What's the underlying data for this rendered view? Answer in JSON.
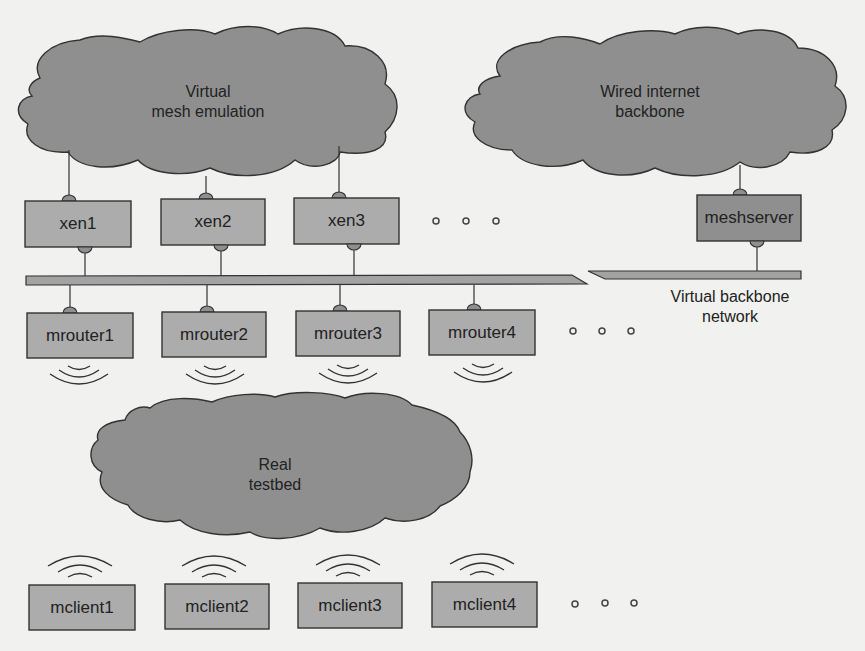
{
  "clouds": {
    "virtual_mesh": {
      "line1": "Virtual",
      "line2": "mesh emulation"
    },
    "wired_backbone": {
      "line1": "Wired internet",
      "line2": "backbone"
    },
    "real_testbed": {
      "line1": "Real",
      "line2": "testbed"
    }
  },
  "xen_nodes": [
    "xen1",
    "xen2",
    "xen3"
  ],
  "meshserver": "meshserver",
  "backbone_label": {
    "line1": "Virtual backbone",
    "line2": "network"
  },
  "mrouters": [
    "mrouter1",
    "mrouter2",
    "mrouter3",
    "mrouter4"
  ],
  "mclients": [
    "mclient1",
    "mclient2",
    "mclient3",
    "mclient4"
  ],
  "ellipsis_icon": "three-dots",
  "wireless_icon": "wifi-waves",
  "colors": {
    "background": "#f1f1ef",
    "cloud_fill": "#8f8f8f",
    "box_fill": "#acacac",
    "meshserver_fill": "#8f8f8f",
    "outline": "#333333"
  }
}
